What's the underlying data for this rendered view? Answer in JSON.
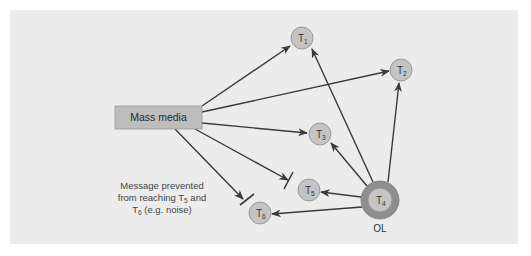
{
  "diagram": {
    "colors": {
      "background": "#ececec",
      "source_box": "#bdbdbd",
      "node_fill": "#c4c4c4",
      "node_stroke": "#8a8a8a",
      "opinion_leader_outer": "#8e8e8e",
      "arrow": "#3a3a3a"
    },
    "source": {
      "label": "Mass media"
    },
    "nodes": [
      {
        "id": "T1",
        "base": "T",
        "sub": "1"
      },
      {
        "id": "T2",
        "base": "T",
        "sub": "2"
      },
      {
        "id": "T3",
        "base": "T",
        "sub": "3"
      },
      {
        "id": "T4",
        "base": "T",
        "sub": "4"
      },
      {
        "id": "T5",
        "base": "T",
        "sub": "5"
      },
      {
        "id": "T6",
        "base": "T",
        "sub": "6"
      }
    ],
    "opinion_leader_label": "OL",
    "note": {
      "line1": "Message prevented",
      "line2_prefix": "from reaching T",
      "line2_sub": "5",
      "line2_suffix": " and",
      "line3_prefix": "T",
      "line3_sub": "6",
      "line3_suffix": " (e.g. noise)"
    },
    "edges": [
      {
        "from": "Mass media",
        "to": "T1",
        "blocked": false
      },
      {
        "from": "Mass media",
        "to": "T2",
        "blocked": false
      },
      {
        "from": "Mass media",
        "to": "T3",
        "blocked": false
      },
      {
        "from": "Mass media",
        "to": "T5",
        "blocked": true
      },
      {
        "from": "Mass media",
        "to": "T6",
        "blocked": true
      },
      {
        "from": "T4",
        "to": "T1",
        "blocked": false
      },
      {
        "from": "T4",
        "to": "T2",
        "blocked": false
      },
      {
        "from": "T4",
        "to": "T3",
        "blocked": false
      },
      {
        "from": "T4",
        "to": "T5",
        "blocked": false
      },
      {
        "from": "T4",
        "to": "T6",
        "blocked": false
      }
    ]
  }
}
